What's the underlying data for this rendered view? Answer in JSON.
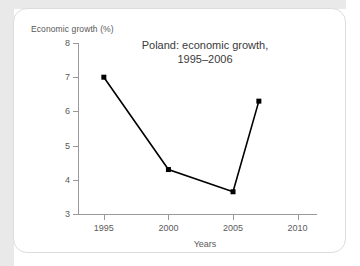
{
  "figure": {
    "title_line1": "Poland: economic growth,",
    "title_line2": "1995–2006",
    "y_axis_caption": "Economic growth (%)",
    "x_axis_caption": "Years"
  },
  "chart_data": {
    "type": "line",
    "title": "Poland: economic growth, 1995–2006",
    "xlabel": "Years",
    "ylabel": "Economic growth (%)",
    "xlim": [
      1993,
      2011.5
    ],
    "ylim": [
      3,
      8
    ],
    "xticks": [
      1995,
      2000,
      2005,
      2010
    ],
    "xtick_labels": [
      "1995",
      "2000",
      "2005",
      "2010"
    ],
    "yticks": [
      3,
      4,
      5,
      6,
      7,
      8
    ],
    "ytick_labels": [
      "3",
      "4",
      "5",
      "6",
      "7",
      "8"
    ],
    "grid": false,
    "legend": false,
    "marker": "square",
    "marker_color": "#000000",
    "line_color": "#000000",
    "series": [
      {
        "name": "Economic growth",
        "x": [
          1995,
          2000,
          2005,
          2007
        ],
        "values": [
          7.0,
          4.3,
          3.65,
          6.3
        ]
      }
    ]
  }
}
